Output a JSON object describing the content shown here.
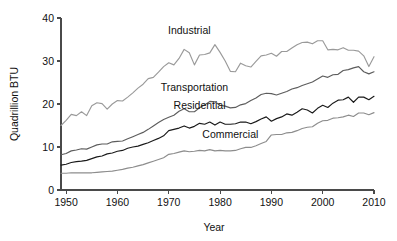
{
  "chart_data": {
    "type": "line",
    "title": "",
    "subtitle": "",
    "xlabel": "Year",
    "ylabel": "Quadrillion BTU",
    "xlim": [
      1949,
      2010
    ],
    "ylim": [
      0,
      40
    ],
    "xticks": [
      1950,
      1960,
      1970,
      1980,
      1990,
      2000,
      2010
    ],
    "xticklabels": [
      "1950",
      "1960",
      "1970",
      "1980",
      "1990",
      "2000",
      "2010"
    ],
    "yticks": [
      0,
      10,
      20,
      30,
      40
    ],
    "yticklabels": [
      "0",
      "10",
      "20",
      "30",
      "40"
    ],
    "grid": false,
    "legend": "inline-annotations",
    "x": [
      1949,
      1950,
      1951,
      1952,
      1953,
      1954,
      1955,
      1956,
      1957,
      1958,
      1959,
      1960,
      1961,
      1962,
      1963,
      1964,
      1965,
      1966,
      1967,
      1968,
      1969,
      1970,
      1971,
      1972,
      1973,
      1974,
      1975,
      1976,
      1977,
      1978,
      1979,
      1980,
      1981,
      1982,
      1983,
      1984,
      1985,
      1986,
      1987,
      1988,
      1989,
      1990,
      1991,
      1992,
      1993,
      1994,
      1995,
      1996,
      1997,
      1998,
      1999,
      2000,
      2001,
      2002,
      2003,
      2004,
      2005,
      2006,
      2007,
      2008,
      2009,
      2010
    ],
    "series": [
      {
        "name": "Industrial",
        "color": "#9a9a9a",
        "label_x": 1974,
        "label_y": 36.2,
        "values": [
          15.0,
          16.2,
          17.6,
          17.3,
          18.2,
          17.3,
          19.6,
          20.3,
          20.1,
          18.8,
          20.0,
          20.8,
          20.7,
          21.6,
          22.6,
          23.7,
          24.6,
          25.9,
          26.2,
          27.4,
          28.7,
          29.6,
          29.1,
          30.6,
          32.7,
          31.9,
          29.1,
          31.4,
          31.5,
          31.9,
          33.8,
          32.0,
          30.0,
          27.6,
          27.5,
          29.5,
          28.9,
          28.6,
          29.9,
          31.2,
          31.4,
          31.8,
          31.1,
          32.2,
          32.2,
          33.0,
          33.8,
          34.3,
          34.4,
          34.0,
          34.7,
          34.7,
          32.6,
          32.7,
          32.6,
          33.1,
          32.5,
          32.5,
          32.3,
          31.2,
          28.7,
          31.0
        ]
      },
      {
        "name": "Transportation",
        "color": "#5d5d5d",
        "label_x": 1975,
        "label_y": 23.1,
        "values": [
          8.2,
          8.5,
          9.1,
          9.3,
          9.6,
          9.5,
          10.0,
          10.5,
          10.7,
          10.7,
          11.2,
          11.3,
          11.4,
          11.9,
          12.4,
          12.9,
          13.4,
          14.1,
          14.9,
          15.7,
          16.4,
          16.9,
          17.4,
          18.3,
          18.9,
          18.2,
          18.2,
          19.1,
          19.8,
          20.6,
          20.5,
          19.7,
          19.5,
          19.1,
          19.2,
          19.8,
          20.1,
          20.8,
          21.4,
          22.2,
          22.5,
          22.4,
          22.1,
          22.5,
          22.9,
          23.5,
          23.8,
          24.3,
          24.7,
          25.1,
          25.8,
          26.5,
          26.2,
          26.8,
          26.9,
          27.8,
          28.0,
          28.4,
          28.7,
          27.5,
          27.0,
          27.5
        ]
      },
      {
        "name": "Residential",
        "color": "#1a1a1a",
        "label_x": 1976,
        "label_y": 18.9,
        "values": [
          5.8,
          6.0,
          6.4,
          6.6,
          6.7,
          6.9,
          7.3,
          7.7,
          7.9,
          8.4,
          8.6,
          9.0,
          9.2,
          9.7,
          10.0,
          10.2,
          10.6,
          11.0,
          11.5,
          12.0,
          12.6,
          13.8,
          14.1,
          14.4,
          14.9,
          14.4,
          14.8,
          15.5,
          15.3,
          15.8,
          15.1,
          15.8,
          15.3,
          15.3,
          15.4,
          15.8,
          15.8,
          15.4,
          15.9,
          16.5,
          17.0,
          16.0,
          16.6,
          17.0,
          17.7,
          17.4,
          18.1,
          18.9,
          18.6,
          17.9,
          19.0,
          19.7,
          19.2,
          20.2,
          20.9,
          21.0,
          21.6,
          20.4,
          21.6,
          21.6,
          21.0,
          21.8
        ]
      },
      {
        "name": "Commercial",
        "color": "#8d8d8d",
        "label_x": 1982,
        "label_y": 12.1,
        "values": [
          3.9,
          3.9,
          4.0,
          4.0,
          4.0,
          4.0,
          4.0,
          4.1,
          4.2,
          4.3,
          4.4,
          4.6,
          4.8,
          5.1,
          5.3,
          5.6,
          5.9,
          6.3,
          6.7,
          7.1,
          7.5,
          8.3,
          8.5,
          8.8,
          9.1,
          8.9,
          9.0,
          9.2,
          9.1,
          9.4,
          9.1,
          9.2,
          9.1,
          9.1,
          9.2,
          9.6,
          9.9,
          9.9,
          10.3,
          10.8,
          11.3,
          12.8,
          12.9,
          12.9,
          13.3,
          13.4,
          13.8,
          14.3,
          14.6,
          14.7,
          15.5,
          16.1,
          16.2,
          16.7,
          16.8,
          17.0,
          17.4,
          17.1,
          17.9,
          17.9,
          17.5,
          18.0
        ]
      }
    ]
  }
}
